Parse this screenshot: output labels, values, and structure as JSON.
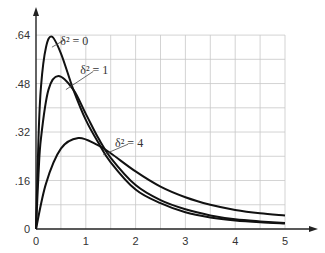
{
  "chart_data": {
    "type": "line",
    "title": "",
    "xlabel": "",
    "ylabel": "",
    "xlim": [
      0,
      5
    ],
    "ylim": [
      0,
      0.64
    ],
    "grid": true,
    "x_ticks": [
      "0",
      "1",
      "2",
      "3",
      "4",
      "5"
    ],
    "y_ticks": [
      "0",
      ".16",
      ".32",
      ".48",
      ".64"
    ],
    "series": [
      {
        "name": "δ² = 0",
        "label": "δ² = 0",
        "points": [
          [
            0,
            0
          ],
          [
            0.05,
            0.3
          ],
          [
            0.1,
            0.47
          ],
          [
            0.2,
            0.6
          ],
          [
            0.32,
            0.635
          ],
          [
            0.5,
            0.58
          ],
          [
            0.75,
            0.46
          ],
          [
            1,
            0.36
          ],
          [
            1.25,
            0.285
          ],
          [
            1.5,
            0.22
          ],
          [
            2,
            0.13
          ],
          [
            2.5,
            0.085
          ],
          [
            3,
            0.055
          ],
          [
            3.5,
            0.038
          ],
          [
            4,
            0.028
          ],
          [
            4.5,
            0.022
          ],
          [
            5,
            0.018
          ]
        ]
      },
      {
        "name": "δ² = 1",
        "label": "δ² = 1",
        "points": [
          [
            0,
            0
          ],
          [
            0.05,
            0.18
          ],
          [
            0.1,
            0.3
          ],
          [
            0.25,
            0.46
          ],
          [
            0.45,
            0.505
          ],
          [
            0.75,
            0.46
          ],
          [
            1,
            0.38
          ],
          [
            1.25,
            0.3
          ],
          [
            1.5,
            0.235
          ],
          [
            2,
            0.145
          ],
          [
            2.5,
            0.095
          ],
          [
            3,
            0.065
          ],
          [
            3.5,
            0.045
          ],
          [
            4,
            0.032
          ],
          [
            4.5,
            0.025
          ],
          [
            5,
            0.02
          ]
        ]
      },
      {
        "name": "δ² = 4",
        "label": "δ² = 4",
        "points": [
          [
            0,
            0
          ],
          [
            0.2,
            0.15
          ],
          [
            0.5,
            0.265
          ],
          [
            0.85,
            0.3
          ],
          [
            1.2,
            0.28
          ],
          [
            1.5,
            0.25
          ],
          [
            2,
            0.19
          ],
          [
            2.5,
            0.14
          ],
          [
            3,
            0.105
          ],
          [
            3.5,
            0.08
          ],
          [
            4,
            0.063
          ],
          [
            4.5,
            0.052
          ],
          [
            5,
            0.045
          ]
        ]
      }
    ],
    "annotations": [
      {
        "text": "δ² = 0",
        "x": 0.85,
        "y": 0.62
      },
      {
        "text": "δ² = 1",
        "x": 1.25,
        "y": 0.525
      },
      {
        "text": "δ² = 4",
        "x": 1.95,
        "y": 0.285
      }
    ]
  }
}
